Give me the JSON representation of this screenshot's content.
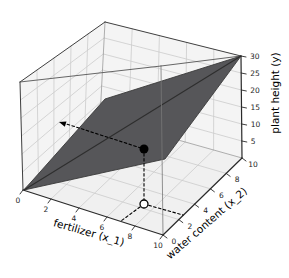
{
  "figure": {
    "background": "#ffffff",
    "pane_wall_color": "#f4f4f4",
    "pane_floor_color": "#f0f0f0",
    "grid_color": "#cccccc",
    "edge_color": "#3f3f3f",
    "plane_color": "#565659",
    "plane_edge_color": "#3a3a3a",
    "point_color": "#000000",
    "projection_marker_fill": "#ffffff"
  },
  "chart_data": {
    "type": "3d-surface",
    "title": "",
    "x_axis": {
      "label": "fertilizer (x_1)",
      "ticks": [
        0,
        2,
        4,
        6,
        8,
        10
      ],
      "range": [
        0,
        10
      ]
    },
    "y_axis": {
      "label": "water content (x_2)",
      "ticks": [
        0,
        2,
        4,
        6,
        8,
        10
      ],
      "range": [
        0,
        10
      ]
    },
    "z_axis": {
      "label": "plant height (y)",
      "ticks": [
        5,
        10,
        15,
        20,
        25,
        30
      ],
      "range": [
        0,
        30
      ]
    },
    "grid": true,
    "surface": {
      "kind": "regression-plane",
      "equation": "plant height = 1.5*x_1 + 1.5*x_2",
      "corners_x1_x2_y": [
        [
          0,
          0,
          0
        ],
        [
          0,
          10,
          15
        ],
        [
          10,
          10,
          30
        ],
        [
          10,
          0,
          15
        ]
      ],
      "diagonal_crease": [
        [
          0,
          0,
          0
        ],
        [
          10,
          10,
          30
        ]
      ]
    },
    "highlighted_point": {
      "x1": 7,
      "x2": 3,
      "y": 15,
      "marker": "filled-black-dot"
    },
    "floor_projection": {
      "x1": 7,
      "x2": 3,
      "marker": "open-circle"
    },
    "guides": [
      "dashed arrow from point toward x1=0 wall at constant height",
      "dashed drop line from point to floor projection",
      "dashed guide from floor projection to x_1 axis",
      "dashed guide from floor projection to x_2 axis"
    ]
  }
}
